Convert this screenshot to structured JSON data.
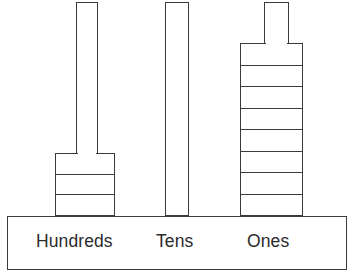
{
  "diagram": {
    "background_color": "#ffffff",
    "stroke_color": "#3a3a3a",
    "fill_color": "#ffffff",
    "text_color": "#2b2b2b"
  },
  "columns": [
    {
      "key": "hundreds",
      "label": "Hundreds",
      "rod": {
        "x": 76,
        "y": 2,
        "width": 22,
        "height": 152
      },
      "block": {
        "x": 55,
        "y": 153,
        "width": 60,
        "height": 63,
        "segments": 3
      },
      "label_x": 35,
      "label_y": 232
    },
    {
      "key": "tens",
      "label": "Tens",
      "rod": {
        "x": 165,
        "y": 2,
        "width": 24,
        "height": 214
      },
      "block": null,
      "label_x": 155,
      "label_y": 232
    },
    {
      "key": "ones",
      "label": "Ones",
      "rod": {
        "x": 264,
        "y": 2,
        "width": 25,
        "height": 42
      },
      "block": {
        "x": 240,
        "y": 43,
        "width": 63,
        "height": 173,
        "segments": 8
      },
      "label_x": 246,
      "label_y": 232
    }
  ],
  "base": {
    "x": 7,
    "y": 216,
    "width": 340,
    "height": 54
  },
  "chart_data": {
    "type": "bar",
    "categories": [
      "Hundreds",
      "Tens",
      "Ones"
    ],
    "values": [
      3,
      0,
      8
    ],
    "value_meaning": "number of stacked unit segments shown in each place-value column",
    "xlabel": "",
    "ylabel": "",
    "grid": false,
    "legend": "none"
  }
}
